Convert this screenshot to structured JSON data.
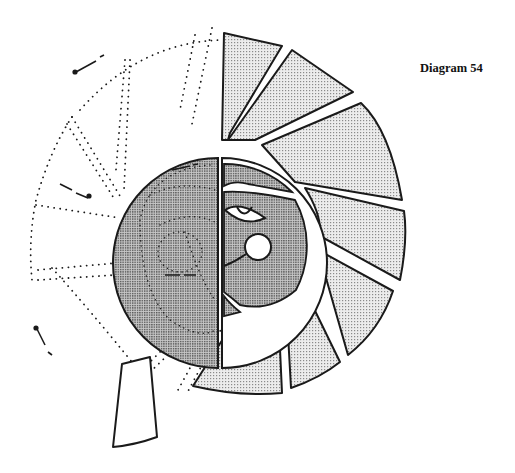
{
  "caption": {
    "label": "Diagram 54"
  },
  "colors": {
    "ink": "#1a1a1a",
    "light_fill": "#e2e2e2",
    "dark_fill": "#b0b0b0",
    "background": "#ffffff"
  },
  "diagram": {
    "center": [
      218,
      263
    ],
    "core_radius": 105,
    "solid_segments": 9,
    "dotted_segments": 6,
    "arrow_marks": 6
  }
}
